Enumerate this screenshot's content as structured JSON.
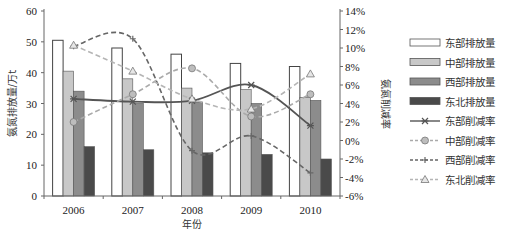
{
  "chart_data": {
    "type": "bar+line",
    "title": "",
    "xlabel": "年份",
    "ylabel": "氨氮排放量/万t",
    "y2label": "氨氮削减率",
    "categories": [
      "2006",
      "2007",
      "2008",
      "2009",
      "2010"
    ],
    "ylim": [
      0,
      60
    ],
    "yticks": [
      "0",
      "10",
      "20",
      "30",
      "40",
      "50",
      "60"
    ],
    "y2lim": [
      -6,
      14
    ],
    "y2ticks": [
      "-6%",
      "-4%",
      "-2%",
      "0%",
      "2%",
      "4%",
      "6%",
      "8%",
      "10%",
      "12%",
      "14%"
    ],
    "grid": false,
    "legend_position": "right",
    "bar_series": [
      {
        "name": "东部排放量",
        "values": [
          50.5,
          48,
          46,
          43,
          42
        ],
        "color": "#ffffff"
      },
      {
        "name": "中部排放量",
        "values": [
          40.5,
          38,
          35,
          34.5,
          32
        ],
        "color": "#c8c8c8"
      },
      {
        "name": "西部排放量",
        "values": [
          34,
          30,
          30.5,
          30,
          31
        ],
        "color": "#8c8c8c"
      },
      {
        "name": "东北排放量",
        "values": [
          16,
          15,
          14,
          13.5,
          12
        ],
        "color": "#4a4a4a"
      }
    ],
    "line_series": [
      {
        "name": "东部削减率",
        "values": [
          4.5,
          4.2,
          4.3,
          6.0,
          1.6
        ],
        "unit": "%",
        "style": "solid",
        "marker": "asterisk",
        "color": "#555555"
      },
      {
        "name": "中部削减率",
        "values": [
          2.0,
          5.0,
          7.8,
          2.6,
          5.0
        ],
        "unit": "%",
        "style": "dashed",
        "marker": "circle",
        "color": "#aaaaaa"
      },
      {
        "name": "西部削减率",
        "values": [
          10.2,
          11.0,
          -1.1,
          0.5,
          -3.5
        ],
        "unit": "%",
        "style": "dashed",
        "marker": "plus",
        "color": "#666666"
      },
      {
        "name": "东北削减率",
        "values": [
          10.3,
          7.5,
          4.5,
          3.4,
          7.2
        ],
        "unit": "%",
        "style": "dashed",
        "marker": "triangle",
        "color": "#b5b5b5"
      }
    ]
  }
}
